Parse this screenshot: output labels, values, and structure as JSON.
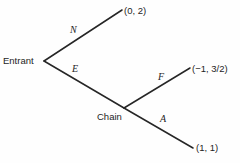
{
  "figure": {
    "type": "extensive-form-game-tree",
    "background_color": "#fefefe",
    "line_color": "#262626"
  },
  "nodes": [
    {
      "id": "entrant",
      "label": "Entrant",
      "x": 44,
      "y": 61
    },
    {
      "id": "chain",
      "label": "Chain",
      "x": 124,
      "y": 108
    }
  ],
  "branches": [
    {
      "id": "n",
      "action": "N",
      "from": "entrant",
      "to_x": 122,
      "to_y": 10,
      "payoff": "(0, 2)"
    },
    {
      "id": "e",
      "action": "E",
      "from": "entrant",
      "to_x": 124,
      "to_y": 108,
      "payoff": ""
    },
    {
      "id": "f",
      "action": "F",
      "from": "chain",
      "to_x": 190,
      "to_y": 68,
      "payoff": "(−1, 3/2)"
    },
    {
      "id": "a",
      "action": "A",
      "from": "chain",
      "to_x": 193,
      "to_y": 148,
      "payoff": "(1, 1)"
    }
  ],
  "labels": {
    "node_entrant": "Entrant",
    "node_chain": "Chain",
    "action_n": "N",
    "action_e": "E",
    "action_f": "F",
    "action_a": "A",
    "payoff_n": "(0, 2)",
    "payoff_f": "(−1, 3/2)",
    "payoff_a": "(1, 1)"
  }
}
